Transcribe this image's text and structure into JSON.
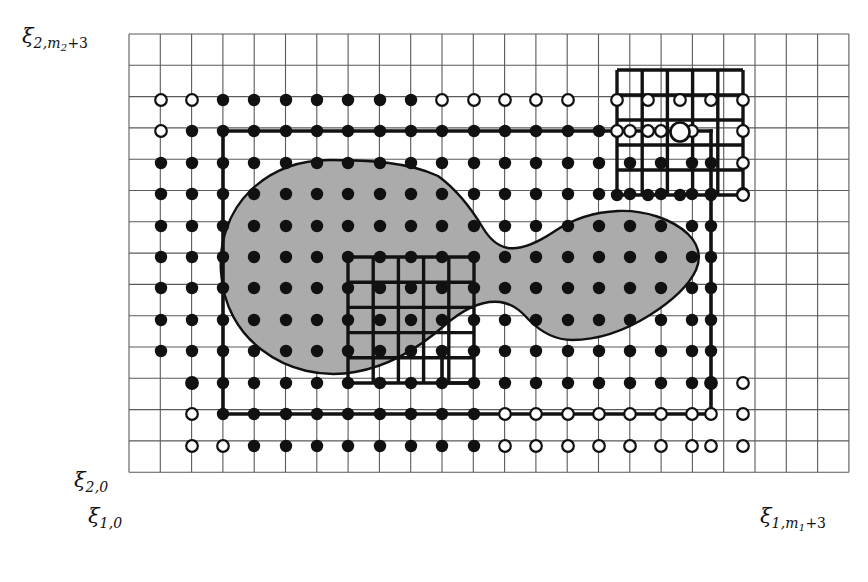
{
  "figure": {
    "background_color": "#ffffff",
    "blob_fill_color": "#ababab",
    "blob_stroke_color": "#111111",
    "grid_line_color": "#5a5a5a",
    "bold_line_color": "#121212",
    "point_fill_color": "#111111",
    "point_open_color": "#ffffff"
  },
  "axis_labels": {
    "y_top": {
      "symbol": "ξ",
      "sub": "2,m",
      "sub_sub": "2",
      "suffix": "+3",
      "text": "ξ2,m2+3"
    },
    "y_bottom": {
      "symbol": "ξ",
      "sub": "2,0",
      "text": "ξ2,0"
    },
    "x_left": {
      "symbol": "ξ",
      "sub": "1,0",
      "text": "ξ1,0"
    },
    "x_right": {
      "symbol": "ξ",
      "sub": "1,m",
      "sub_sub": "1",
      "suffix": "+3",
      "text": "ξ1,m1+3"
    }
  },
  "grid": {
    "origin_x": 129,
    "origin_y": 34,
    "cell": 31.3,
    "n_cols": 23,
    "n_rows": 14,
    "line_width": 1.1
  },
  "blob_path": "M 330 160 C 300 160 272 170 251 190 C 228 212 219 243 221 272 C 223 305 238 332 262 350 C 288 370 322 378 355 372 C 390 366 420 347 445 325 C 466 307 483 300 500 302 C 513 304 521 311 529 320 C 541 332 555 340 572 340 C 600 340 626 330 650 315 C 672 301 689 285 696 270 C 702 256 698 244 688 234 C 672 219 645 210 618 211 C 595 212 573 219 555 231 C 537 243 522 250 508 248 C 497 246 489 238 483 228 C 471 208 456 189 438 176 C 408 162 368 160 330 160 Z",
  "inner_subgrid": {
    "x0": 348,
    "y0": 257,
    "x1": 474,
    "y1": 383,
    "cols": 5,
    "rows": 5,
    "line_width": 3.4
  },
  "corner_subgrid": {
    "x0": 617,
    "y0": 70,
    "x1": 743,
    "y1": 195,
    "cols": 5,
    "rows": 5,
    "line_width": 3.4,
    "big_node": {
      "x": 680,
      "y": 132,
      "r": 9.5
    }
  },
  "bold_outline": {
    "line_width": 3.6,
    "segments": [
      [
        223,
        131,
        711,
        131
      ],
      [
        223,
        131,
        223,
        414
      ],
      [
        711,
        131,
        711,
        414
      ],
      [
        223,
        414,
        711,
        414
      ]
    ],
    "notch_segments": [
      [
        442,
        352,
        442,
        383
      ],
      [
        442,
        383,
        474,
        383
      ]
    ]
  },
  "point_radius_filled": 6.2,
  "point_radius_open": 5.8,
  "nodes_filled": [
    [
      223,
      100
    ],
    [
      254,
      100
    ],
    [
      286,
      100
    ],
    [
      317,
      100
    ],
    [
      348,
      100
    ],
    [
      380,
      100
    ],
    [
      411,
      100
    ],
    [
      192,
      131
    ],
    [
      223,
      131
    ],
    [
      254,
      131
    ],
    [
      286,
      131
    ],
    [
      317,
      131
    ],
    [
      348,
      131
    ],
    [
      380,
      131
    ],
    [
      411,
      131
    ],
    [
      442,
      131
    ],
    [
      474,
      131
    ],
    [
      505,
      131
    ],
    [
      536,
      131
    ],
    [
      568,
      131
    ],
    [
      599,
      131
    ],
    [
      161,
      163
    ],
    [
      192,
      163
    ],
    [
      223,
      163
    ],
    [
      254,
      163
    ],
    [
      286,
      163
    ],
    [
      317,
      163
    ],
    [
      348,
      163
    ],
    [
      380,
      163
    ],
    [
      411,
      163
    ],
    [
      442,
      163
    ],
    [
      474,
      163
    ],
    [
      505,
      163
    ],
    [
      536,
      163
    ],
    [
      568,
      163
    ],
    [
      599,
      163
    ],
    [
      630,
      163
    ],
    [
      661,
      163
    ],
    [
      692,
      163
    ],
    [
      711,
      163
    ],
    [
      161,
      194
    ],
    [
      192,
      194
    ],
    [
      223,
      194
    ],
    [
      254,
      194
    ],
    [
      286,
      194
    ],
    [
      317,
      194
    ],
    [
      348,
      194
    ],
    [
      380,
      194
    ],
    [
      411,
      194
    ],
    [
      442,
      194
    ],
    [
      474,
      194
    ],
    [
      505,
      194
    ],
    [
      536,
      194
    ],
    [
      568,
      194
    ],
    [
      599,
      194
    ],
    [
      630,
      194
    ],
    [
      661,
      194
    ],
    [
      692,
      194
    ],
    [
      711,
      194
    ],
    [
      161,
      226
    ],
    [
      192,
      226
    ],
    [
      223,
      226
    ],
    [
      254,
      226
    ],
    [
      286,
      226
    ],
    [
      317,
      226
    ],
    [
      348,
      226
    ],
    [
      380,
      226
    ],
    [
      411,
      226
    ],
    [
      442,
      226
    ],
    [
      474,
      226
    ],
    [
      505,
      226
    ],
    [
      536,
      226
    ],
    [
      568,
      226
    ],
    [
      599,
      226
    ],
    [
      630,
      226
    ],
    [
      661,
      226
    ],
    [
      692,
      226
    ],
    [
      711,
      226
    ],
    [
      161,
      257
    ],
    [
      192,
      257
    ],
    [
      223,
      257
    ],
    [
      254,
      257
    ],
    [
      286,
      257
    ],
    [
      317,
      257
    ],
    [
      348,
      257
    ],
    [
      380,
      257
    ],
    [
      411,
      257
    ],
    [
      442,
      257
    ],
    [
      474,
      257
    ],
    [
      505,
      257
    ],
    [
      536,
      257
    ],
    [
      568,
      257
    ],
    [
      599,
      257
    ],
    [
      630,
      257
    ],
    [
      661,
      257
    ],
    [
      692,
      257
    ],
    [
      711,
      257
    ],
    [
      161,
      288
    ],
    [
      192,
      288
    ],
    [
      223,
      288
    ],
    [
      254,
      288
    ],
    [
      286,
      288
    ],
    [
      317,
      288
    ],
    [
      348,
      288
    ],
    [
      380,
      288
    ],
    [
      411,
      288
    ],
    [
      442,
      288
    ],
    [
      474,
      288
    ],
    [
      505,
      288
    ],
    [
      536,
      288
    ],
    [
      568,
      288
    ],
    [
      599,
      288
    ],
    [
      630,
      288
    ],
    [
      661,
      288
    ],
    [
      692,
      288
    ],
    [
      711,
      288
    ],
    [
      161,
      320
    ],
    [
      192,
      320
    ],
    [
      223,
      320
    ],
    [
      254,
      320
    ],
    [
      286,
      320
    ],
    [
      317,
      320
    ],
    [
      348,
      320
    ],
    [
      380,
      320
    ],
    [
      411,
      320
    ],
    [
      442,
      320
    ],
    [
      474,
      320
    ],
    [
      505,
      320
    ],
    [
      536,
      320
    ],
    [
      568,
      320
    ],
    [
      599,
      320
    ],
    [
      630,
      320
    ],
    [
      661,
      320
    ],
    [
      692,
      320
    ],
    [
      711,
      320
    ],
    [
      161,
      351
    ],
    [
      192,
      351
    ],
    [
      223,
      351
    ],
    [
      254,
      351
    ],
    [
      286,
      351
    ],
    [
      317,
      351
    ],
    [
      348,
      351
    ],
    [
      380,
      351
    ],
    [
      411,
      351
    ],
    [
      442,
      351
    ],
    [
      474,
      351
    ],
    [
      505,
      351
    ],
    [
      536,
      351
    ],
    [
      568,
      351
    ],
    [
      599,
      351
    ],
    [
      630,
      351
    ],
    [
      661,
      351
    ],
    [
      692,
      351
    ],
    [
      711,
      351
    ],
    [
      192,
      383
    ],
    [
      223,
      383
    ],
    [
      254,
      383
    ],
    [
      286,
      383
    ],
    [
      317,
      383
    ],
    [
      348,
      383
    ],
    [
      380,
      383
    ],
    [
      411,
      383
    ],
    [
      442,
      383
    ],
    [
      474,
      383
    ],
    [
      505,
      383
    ],
    [
      536,
      383
    ],
    [
      568,
      383
    ],
    [
      599,
      383
    ],
    [
      630,
      383
    ],
    [
      661,
      383
    ],
    [
      692,
      383
    ],
    [
      711,
      383
    ],
    [
      223,
      414
    ],
    [
      254,
      414
    ],
    [
      286,
      414
    ],
    [
      317,
      414
    ],
    [
      348,
      414
    ],
    [
      380,
      414
    ],
    [
      411,
      414
    ],
    [
      442,
      414
    ],
    [
      474,
      414
    ],
    [
      254,
      446
    ],
    [
      286,
      446
    ],
    [
      317,
      446
    ],
    [
      348,
      446
    ],
    [
      380,
      446
    ],
    [
      411,
      446
    ],
    [
      442,
      446
    ],
    [
      474,
      446
    ],
    [
      617,
      195
    ],
    [
      648,
      195
    ],
    [
      680,
      195
    ],
    [
      711,
      195
    ]
  ],
  "nodes_open": [
    [
      161,
      100
    ],
    [
      192,
      100
    ],
    [
      442,
      100
    ],
    [
      474,
      100
    ],
    [
      505,
      100
    ],
    [
      536,
      100
    ],
    [
      568,
      100
    ],
    [
      161,
      131
    ],
    [
      630,
      131
    ],
    [
      661,
      131
    ],
    [
      692,
      131
    ],
    [
      743,
      131
    ],
    [
      617,
      100
    ],
    [
      648,
      100
    ],
    [
      680,
      100
    ],
    [
      711,
      100
    ],
    [
      743,
      100
    ],
    [
      617,
      131
    ],
    [
      648,
      131
    ],
    [
      743,
      163
    ],
    [
      743,
      194
    ],
    [
      743,
      195
    ],
    [
      192,
      383
    ],
    [
      192,
      414
    ],
    [
      505,
      414
    ],
    [
      536,
      414
    ],
    [
      568,
      414
    ],
    [
      599,
      414
    ],
    [
      630,
      414
    ],
    [
      661,
      414
    ],
    [
      692,
      414
    ],
    [
      711,
      414
    ],
    [
      743,
      414
    ],
    [
      192,
      446
    ],
    [
      223,
      446
    ],
    [
      505,
      446
    ],
    [
      536,
      446
    ],
    [
      568,
      446
    ],
    [
      599,
      446
    ],
    [
      630,
      446
    ],
    [
      661,
      446
    ],
    [
      692,
      446
    ],
    [
      711,
      446
    ],
    [
      743,
      446
    ],
    [
      711,
      383
    ],
    [
      743,
      383
    ]
  ],
  "legend_note": ""
}
